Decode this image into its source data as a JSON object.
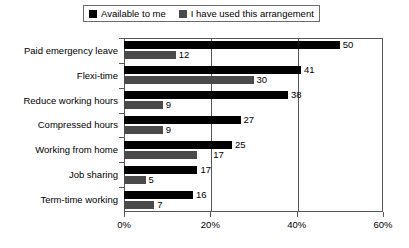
{
  "chart_data": {
    "type": "bar",
    "orientation": "horizontal",
    "title": "",
    "xlabel": "",
    "ylabel": "",
    "xlim": [
      0,
      60
    ],
    "xticks": [
      "0%",
      "20%",
      "40%",
      "60%"
    ],
    "xtick_values": [
      0,
      20,
      40,
      60
    ],
    "grid": true,
    "gridlines_at": [
      20,
      40
    ],
    "legend_position": "top",
    "categories": [
      "Paid emergency leave",
      "Flexi-time",
      "Reduce working hours",
      "Compressed hours",
      "Working from home",
      "Job sharing",
      "Term-time working"
    ],
    "series": [
      {
        "name": "Available to me",
        "color": "#000000",
        "values": [
          50,
          41,
          38,
          27,
          25,
          17,
          16
        ]
      },
      {
        "name": "I have used this arrangement",
        "color": "#4a4a4a",
        "values": [
          12,
          30,
          9,
          9,
          17,
          5,
          7
        ]
      }
    ]
  },
  "legend": {
    "entries": [
      {
        "label": "Available to me",
        "swatch": "legend-swatch-black"
      },
      {
        "label": "I have used this arrangement",
        "swatch": "legend-swatch-gray"
      }
    ]
  },
  "colors": {
    "series_available": "#000000",
    "series_used": "#4a4a4a",
    "axis": "#575757",
    "background": "#ffffff",
    "text": "#000000"
  },
  "axis": {
    "x_tick_labels": [
      "0%",
      "20%",
      "40%",
      "60%"
    ]
  }
}
